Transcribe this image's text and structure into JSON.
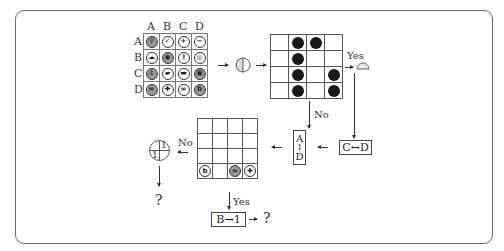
{
  "diagram": {
    "grid_columns": [
      "A",
      "B",
      "C",
      "D"
    ],
    "grid_rows": [
      "A",
      "B",
      "C",
      "D"
    ],
    "icon_grid": [
      [
        {
          "icon": "search",
          "glyph": "⚲",
          "fill": "gray"
        },
        {
          "icon": "check",
          "glyph": "✓",
          "fill": "white"
        },
        {
          "icon": "plus-circle",
          "glyph": "+",
          "fill": "white"
        },
        {
          "icon": "minus",
          "glyph": "−",
          "fill": "white"
        }
      ],
      [
        {
          "icon": "cloud",
          "glyph": "☁",
          "fill": "white"
        },
        {
          "icon": "target",
          "glyph": "◉",
          "fill": "gray"
        },
        {
          "icon": "key",
          "glyph": "⚷",
          "fill": "white"
        },
        {
          "icon": "eye",
          "glyph": "◎",
          "fill": "white"
        }
      ],
      [
        {
          "icon": "anchor",
          "glyph": "⚓",
          "fill": "gray"
        },
        {
          "icon": "chat",
          "glyph": "▰",
          "fill": "white"
        },
        {
          "icon": "message",
          "glyph": "▬",
          "fill": "white"
        },
        {
          "icon": "image",
          "glyph": "▣",
          "fill": "gray"
        }
      ],
      [
        {
          "icon": "infinity",
          "glyph": "∞",
          "fill": "gray"
        },
        {
          "icon": "plus",
          "glyph": "✚",
          "fill": "white"
        },
        {
          "icon": "link",
          "glyph": "∞",
          "fill": "white"
        },
        {
          "icon": "b-letter",
          "glyph": "b",
          "fill": "gray"
        }
      ]
    ],
    "operator_symbol": "circle-half",
    "dot_grid": [
      [
        0,
        1,
        1,
        0
      ],
      [
        0,
        1,
        0,
        0
      ],
      [
        0,
        1,
        0,
        1
      ],
      [
        0,
        1,
        0,
        1
      ]
    ],
    "yes_label_1": "Yes",
    "no_label_1": "No",
    "swap_cd_label": "C↔D",
    "swap_ad": {
      "top": "A",
      "arrow": "↕",
      "bottom": "D"
    },
    "result_grid_bottom_row": [
      {
        "icon": "b-letter",
        "glyph": "b"
      },
      {
        "icon": "empty",
        "glyph": ""
      },
      {
        "icon": "link",
        "glyph": "∞"
      },
      {
        "icon": "plus",
        "glyph": "✚"
      }
    ],
    "no_label_2": "No",
    "yes_label_2": "Yes",
    "rotation_symbol": {
      "top_right": "1",
      "bottom_left": "1"
    },
    "question_1": "?",
    "replace_label": "B→1",
    "question_2": "?"
  }
}
